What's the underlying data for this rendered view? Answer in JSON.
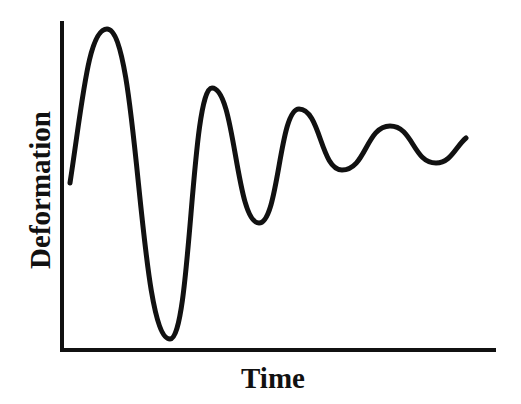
{
  "chart_data": {
    "type": "line",
    "title": "",
    "xlabel": "Time",
    "ylabel": "Deformation",
    "grid": false,
    "legend": null,
    "ticks": false,
    "series": [
      {
        "name": "Deformation",
        "color": "#111111",
        "points_px": [
          [
            70,
            183
          ],
          [
            107,
            29
          ],
          [
            170,
            339
          ],
          [
            212,
            88
          ],
          [
            259,
            223
          ],
          [
            299,
            109
          ],
          [
            342,
            170
          ],
          [
            390,
            126
          ],
          [
            436,
            163
          ],
          [
            466,
            138
          ]
        ],
        "extrema": [
          "start",
          "peak",
          "trough",
          "peak",
          "trough",
          "peak",
          "trough",
          "peak",
          "trough",
          "end"
        ]
      }
    ],
    "axes": {
      "y_axis": {
        "x": 62,
        "y_top": 21,
        "y_bottom": 350
      },
      "x_axis": {
        "y": 350,
        "x_left": 62,
        "x_right": 496
      }
    }
  },
  "labels": {
    "x": "Time",
    "y": "Deformation"
  }
}
